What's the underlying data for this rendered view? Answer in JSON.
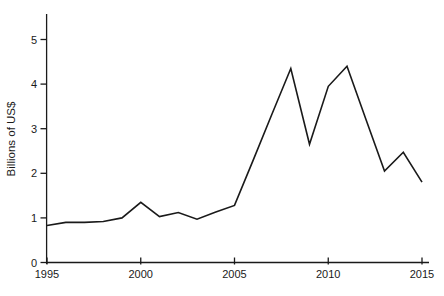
{
  "chart_data": {
    "type": "line",
    "title": "",
    "xlabel": "",
    "ylabel": "Billions of US$",
    "x": [
      1995,
      1996,
      1997,
      1998,
      1999,
      2000,
      2001,
      2002,
      2003,
      2004,
      2005,
      2006,
      2007,
      2008,
      2009,
      2010,
      2011,
      2012,
      2013,
      2014,
      2015
    ],
    "series": [
      {
        "name": "Billions of US$",
        "values": [
          0.83,
          0.9,
          0.9,
          0.92,
          1.0,
          1.35,
          1.03,
          1.12,
          0.97,
          1.13,
          1.28,
          2.3,
          3.33,
          4.35,
          2.65,
          3.95,
          4.4,
          3.22,
          2.05,
          2.47,
          1.8
        ]
      }
    ],
    "x_ticks": [
      1995,
      2000,
      2005,
      2010,
      2015
    ],
    "y_ticks": [
      0,
      1,
      2,
      3,
      4,
      5
    ],
    "xlim": [
      1995,
      2015
    ],
    "ylim": [
      0,
      5.55
    ],
    "grid": false,
    "legend": "none",
    "line_color": "#1a1a1a",
    "axis_color": "#1a1a1a",
    "text_color": "#1a1a1a",
    "background_color": "#ffffff"
  }
}
